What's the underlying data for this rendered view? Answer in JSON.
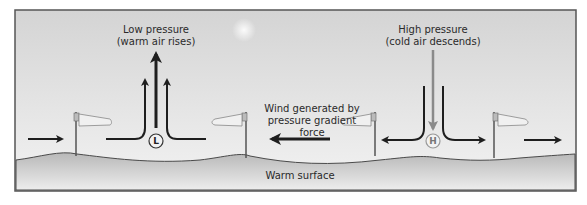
{
  "diagram": {
    "low_pressure": {
      "title": "Low pressure",
      "subtitle": "(warm air rises)",
      "symbol": "L"
    },
    "high_pressure": {
      "title": "High pressure",
      "subtitle": "(cold air descends)",
      "symbol": "H"
    },
    "wind_label": {
      "line1": "Wind generated by",
      "line2": "pressure gradient",
      "line3": "force"
    },
    "surface_label": "Warm surface",
    "colors": {
      "sky_top": "#d6d6d6",
      "sky_bottom": "#f2f2f2",
      "ground_top": "#bdbdbd",
      "ground_bottom": "#efefef",
      "frame": "#555555",
      "arrow_dark": "#1e1e1e",
      "arrow_gray": "#8a8a8a"
    }
  }
}
